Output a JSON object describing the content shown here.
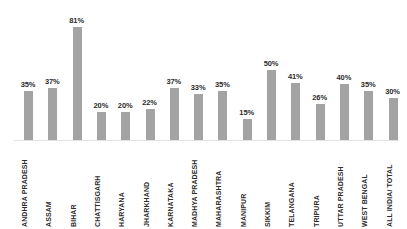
{
  "chart": {
    "background_color": "#ffffff",
    "bar_color": "#a3a3a3",
    "label_color": "#2b2b2b",
    "axis_color": "#e2e2e2"
  },
  "chart_data": {
    "type": "bar",
    "title": "",
    "subtitle": "",
    "xlabel": "",
    "ylabel": "",
    "ylim": [
      0,
      81
    ],
    "grid": false,
    "legend": false,
    "value_suffix": "%",
    "categories": [
      "ANDHRA PRADESH",
      "ASSAM",
      "BIHAR",
      "CHATTISGARH",
      "HARYANA",
      "JHARKHAND",
      "KARNATAKA",
      "MADHYA PRADESH",
      "MAHARASHTRA",
      "MANIPUR",
      "SIKKIM",
      "TELANGANA",
      "TRIPURA",
      "UTTAR PRADESH",
      "WEST BENGAL",
      "ALL INDIA/ TOTAL"
    ],
    "values": [
      35,
      37,
      81,
      20,
      20,
      22,
      37,
      33,
      35,
      15,
      50,
      41,
      26,
      40,
      35,
      30
    ],
    "data_labels": [
      "35%",
      "37%",
      "81%",
      "20%",
      "20%",
      "22%",
      "37%",
      "33%",
      "35%",
      "15%",
      "50%",
      "41%",
      "26%",
      "40%",
      "35%",
      "30%"
    ]
  }
}
